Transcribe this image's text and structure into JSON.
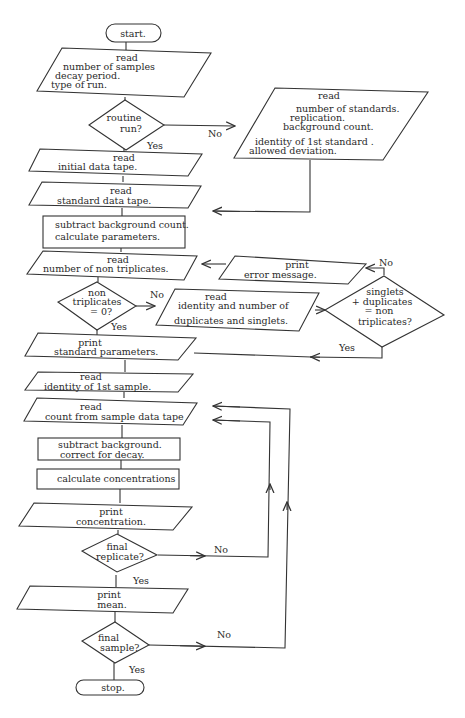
{
  "diagram": {
    "type": "flowchart",
    "nodes": {
      "start": {
        "shape": "terminal",
        "lines": [
          "start."
        ]
      },
      "read_samples": {
        "shape": "io",
        "lines": [
          "read",
          "number of samples",
          "decay period.",
          "type of run."
        ]
      },
      "routine_run": {
        "shape": "decision",
        "lines": [
          "routine",
          "run?"
        ]
      },
      "read_standards": {
        "shape": "io",
        "lines": [
          "read",
          "number of standards.",
          "replication.",
          "background count.",
          "identity of 1st standard .",
          "allowed deviation."
        ]
      },
      "read_initial": {
        "shape": "io",
        "lines": [
          "read",
          "initial data tape."
        ]
      },
      "read_standard_tape": {
        "shape": "io",
        "lines": [
          "read",
          "standard data tape."
        ]
      },
      "subtract_bg_calc": {
        "shape": "process",
        "lines": [
          "subtract background count.",
          "calculate parameters."
        ]
      },
      "read_non_trip": {
        "shape": "io",
        "lines": [
          "read",
          "number of non triplicates."
        ]
      },
      "print_error": {
        "shape": "io",
        "lines": [
          "print",
          "error message."
        ]
      },
      "non_trip_zero": {
        "shape": "decision",
        "lines": [
          "non",
          "triplicates",
          "= 0?"
        ]
      },
      "read_dup_single": {
        "shape": "io",
        "lines": [
          "read",
          "identity and number of",
          "duplicates and singlets."
        ]
      },
      "singlets_check": {
        "shape": "decision",
        "lines": [
          "singlets",
          "+ duplicates",
          "= non",
          "triplicates?"
        ]
      },
      "print_std_params": {
        "shape": "io",
        "lines": [
          "print",
          "standard parameters."
        ]
      },
      "read_first_sample": {
        "shape": "io",
        "lines": [
          "read",
          "identity of 1st sample."
        ]
      },
      "read_count": {
        "shape": "io",
        "lines": [
          "read",
          "count from sample data tape"
        ]
      },
      "subtract_bg_decay": {
        "shape": "process",
        "lines": [
          "subtract background.",
          "correct for decay."
        ]
      },
      "calc_conc": {
        "shape": "process",
        "lines": [
          "calculate concentrations"
        ]
      },
      "print_conc": {
        "shape": "io",
        "lines": [
          "print",
          "concentration."
        ]
      },
      "final_replicate": {
        "shape": "decision",
        "lines": [
          "final",
          "replicate?"
        ]
      },
      "print_mean": {
        "shape": "io",
        "lines": [
          "print",
          "mean."
        ]
      },
      "final_sample": {
        "shape": "decision",
        "lines": [
          "final",
          "sample?"
        ]
      },
      "stop": {
        "shape": "terminal",
        "lines": [
          "stop."
        ]
      }
    },
    "edge_labels": {
      "routine_no": "No",
      "routine_yes": "Yes",
      "nontrip_no": "No",
      "nontrip_yes": "Yes",
      "singlets_no": "No",
      "singlets_yes": "Yes",
      "replicate_no": "No",
      "replicate_yes": "Yes",
      "sample_no": "No",
      "sample_yes": "Yes"
    }
  }
}
